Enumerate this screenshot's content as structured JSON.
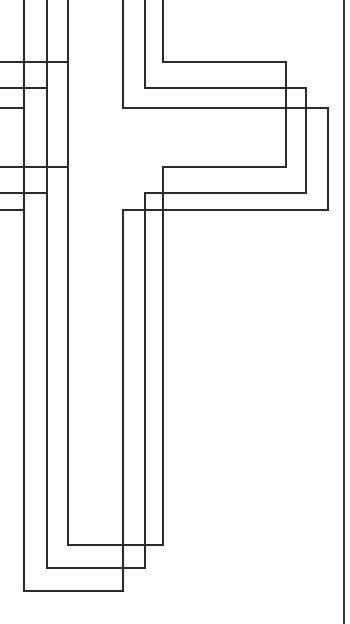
{
  "document": {
    "title": "Cross Coloring Page",
    "kind": "line-art-coloring-page",
    "subject": "latin-cross",
    "background_color": "#ffffff",
    "line_color": "#2b2b2b",
    "canvas": {
      "width": 350,
      "height": 624
    },
    "crop_note": "Cross is cropped at the top and left edges of the page"
  },
  "artwork": {
    "outline_count": 3,
    "page_edge": {
      "name": "right-page-border",
      "x": 344,
      "y1": 0,
      "y2": 624,
      "stroke_width": 1.9
    },
    "outlines": [
      {
        "name": "outer-cross-outline",
        "stroke_width": 2.1,
        "points": "68,-10 68,108 328,108 328,210 68,210 68,591 24,591 24,-10",
        "geometry": {
          "stem_left_x": 24,
          "stem_right_x": 68,
          "arm_top_y": 108,
          "arm_bottom_y": 210,
          "arm_right_x": 328,
          "stem_bottom_y": 591
        }
      },
      {
        "name": "middle-cross-outline",
        "stroke_width": 2.0,
        "points": "47,-10 47,88 306,88 306,193 47,193 47,568 24,568 24,-10",
        "geometry": {
          "stem_left_x": 24,
          "stem_right_x": 47,
          "arm_top_y": 88,
          "arm_bottom_y": 193,
          "arm_right_x": 306,
          "stem_bottom_y": 568
        }
      },
      {
        "name": "inner-cross-outline",
        "stroke_width": 2.0,
        "points": "24,-10 24,62 286,62 286,167 24,167 24,545",
        "geometry": {
          "arm_top_y": 62,
          "arm_bottom_y": 167,
          "arm_right_x": 286,
          "stem_bottom_y": 545
        }
      }
    ],
    "right_arm_nested_lines": [
      {
        "name": "outer-right-arm-left-wall",
        "x": 123,
        "y1": -10,
        "y2": 591
      },
      {
        "name": "middle-right-arm-left-wall",
        "x": 145,
        "y1": -10,
        "y2": 568
      },
      {
        "name": "inner-right-arm-left-wall",
        "x": 163,
        "y1": -10,
        "y2": 545
      }
    ]
  }
}
